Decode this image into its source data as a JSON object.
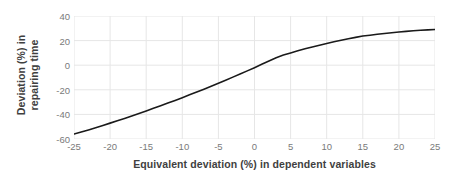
{
  "chart_data": {
    "type": "line",
    "title": "",
    "xlabel": "Equivalent deviation (%) in dependent variables",
    "ylabel": "Deviation (%) in repairing time",
    "ylabel_line1": "Deviation (%) in",
    "ylabel_line2": "repairing time",
    "xlim": [
      -25,
      25
    ],
    "ylim": [
      -60,
      40
    ],
    "xticks": [
      -25,
      -20,
      -15,
      -10,
      -5,
      0,
      5,
      10,
      15,
      20,
      25
    ],
    "yticks": [
      -60,
      -40,
      -20,
      0,
      20,
      40
    ],
    "xtick_labels": [
      "-25",
      "-20",
      "-15",
      "-10",
      "-5",
      "0",
      "5",
      "10",
      "15",
      "20",
      "25"
    ],
    "ytick_labels": [
      "-60",
      "-40",
      "-20",
      "0",
      "20",
      "40"
    ],
    "grid": true,
    "legend": "none",
    "series": [
      {
        "name": "deviation curve",
        "color": "#1a1a1a",
        "line_width": 1.6,
        "x": [
          -25,
          -24,
          -23,
          -22,
          -21,
          -20,
          -19,
          -18,
          -17,
          -16,
          -15,
          -14,
          -13,
          -12,
          -11,
          -10,
          -9,
          -8,
          -7,
          -6,
          -5,
          -4,
          -3,
          -2,
          -1,
          0,
          1,
          2,
          3,
          4,
          5,
          6,
          7,
          8,
          9,
          10,
          11,
          12,
          13,
          14,
          15,
          16,
          17,
          18,
          19,
          20,
          21,
          22,
          23,
          24,
          25
        ],
        "values": [
          -56.0,
          -54.3,
          -52.6,
          -50.8,
          -49.0,
          -47.1,
          -45.2,
          -43.3,
          -41.3,
          -39.3,
          -37.2,
          -35.1,
          -33.0,
          -30.8,
          -28.6,
          -26.4,
          -24.1,
          -21.8,
          -19.5,
          -17.1,
          -14.7,
          -12.2,
          -9.7,
          -7.2,
          -4.6,
          -2.0,
          0.7,
          3.4,
          6.1,
          8.2,
          10.0,
          11.7,
          13.3,
          14.8,
          16.3,
          17.7,
          19.0,
          20.3,
          21.5,
          22.6,
          23.7,
          24.4,
          25.1,
          25.8,
          26.4,
          27.0,
          27.5,
          28.0,
          28.4,
          28.7,
          29.0
        ]
      }
    ],
    "style": {
      "grid_color": "#e6e6e6",
      "tick_label_color": "#7a7a7a",
      "axis_title_color": "#3f3f3f",
      "plot_background": "#ffffff",
      "curve_color": "#1a1a1a"
    }
  }
}
